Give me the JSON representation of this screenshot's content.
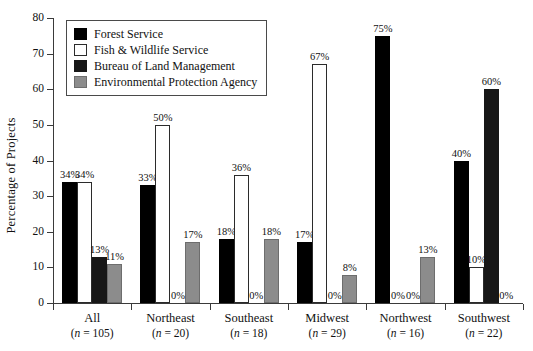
{
  "chart_data": {
    "type": "bar",
    "title": "",
    "xlabel": "",
    "ylabel": "Percentage of Projects",
    "ylim": [
      0,
      80
    ],
    "yticks": [
      0,
      10,
      20,
      30,
      40,
      50,
      60,
      70,
      80
    ],
    "grid": false,
    "legend_position": "top-left",
    "categories": [
      "All",
      "Northeast",
      "Southeast",
      "Midwest",
      "Northwest",
      "Southwest"
    ],
    "category_counts": [
      "(n = 105)",
      "(n = 20)",
      "(n = 18)",
      "(n = 29)",
      "(n = 16)",
      "(n = 22)"
    ],
    "series": [
      {
        "name": "Forest Service",
        "color": "#000000",
        "values": [
          34,
          33,
          18,
          17,
          75,
          40
        ],
        "labels": [
          "34%",
          "33%",
          "18%",
          "17%",
          "75%",
          "40%"
        ]
      },
      {
        "name": "Fish & Wildlife Service",
        "color": "#ffffff",
        "values": [
          34,
          50,
          36,
          67,
          0,
          10
        ],
        "labels": [
          "34%",
          "50%",
          "36%",
          "67%",
          "0%",
          "10%"
        ]
      },
      {
        "name": "Bureau of Land Management",
        "color": "#171717",
        "values": [
          13,
          0,
          0,
          0,
          0,
          60
        ],
        "labels": [
          "13%",
          "0%",
          "0%",
          "0%",
          "0%",
          "60%"
        ]
      },
      {
        "name": "Environmental Protection Agency",
        "color": "#8c8c8c",
        "values": [
          11,
          17,
          18,
          8,
          13,
          0
        ],
        "labels": [
          "11%",
          "17%",
          "18%",
          "8%",
          "13%",
          "0%"
        ]
      }
    ]
  },
  "axis": {
    "y_title": "Percentage of Projects",
    "y_tick_labels": [
      "80",
      "70",
      "60",
      "50",
      "40",
      "30",
      "20",
      "10",
      "0"
    ]
  },
  "legend": {
    "items": [
      {
        "label": "Forest Service"
      },
      {
        "label": "Fish & Wildlife Service"
      },
      {
        "label": "Bureau of Land Management"
      },
      {
        "label": "Environmental Protection Agency"
      }
    ]
  }
}
